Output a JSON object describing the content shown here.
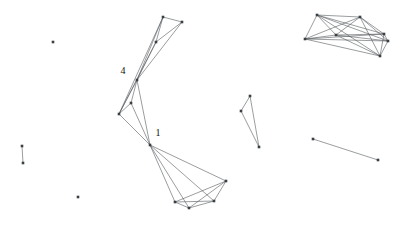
{
  "figure": {
    "title": "",
    "background_color": "#ffffff",
    "width": 413,
    "height": 235
  },
  "chart_data": {
    "type": "scatter",
    "title": "",
    "xlabel": "",
    "ylabel": "",
    "xlim": [
      0,
      413
    ],
    "ylim": [
      0,
      235
    ],
    "grid": false,
    "legend": null,
    "node_color": "#3a3f44",
    "edge_color": "#555a5e",
    "node_size": 2.6,
    "edge_width": 0.6,
    "nodes": [
      {
        "id": "n0",
        "x": 163,
        "y": 17,
        "label": ""
      },
      {
        "id": "n1",
        "x": 182,
        "y": 22,
        "label": ""
      },
      {
        "id": "n2",
        "x": 156,
        "y": 42,
        "label": ""
      },
      {
        "id": "n3",
        "x": 137,
        "y": 80,
        "label": "4"
      },
      {
        "id": "n4",
        "x": 131,
        "y": 103,
        "label": ""
      },
      {
        "id": "n5",
        "x": 119,
        "y": 114,
        "label": ""
      },
      {
        "id": "n6",
        "x": 150,
        "y": 145,
        "label": "1"
      },
      {
        "id": "n7",
        "x": 226,
        "y": 181,
        "label": ""
      },
      {
        "id": "n8",
        "x": 175,
        "y": 202,
        "label": ""
      },
      {
        "id": "n9",
        "x": 214,
        "y": 201,
        "label": ""
      },
      {
        "id": "n10",
        "x": 189,
        "y": 208,
        "label": ""
      },
      {
        "id": "n11",
        "x": 250,
        "y": 96,
        "label": ""
      },
      {
        "id": "n12",
        "x": 241,
        "y": 111,
        "label": ""
      },
      {
        "id": "n13",
        "x": 259,
        "y": 147,
        "label": ""
      },
      {
        "id": "n14",
        "x": 317,
        "y": 15,
        "label": ""
      },
      {
        "id": "n15",
        "x": 360,
        "y": 17,
        "label": ""
      },
      {
        "id": "n16",
        "x": 305,
        "y": 39,
        "label": ""
      },
      {
        "id": "n17",
        "x": 336,
        "y": 35,
        "label": ""
      },
      {
        "id": "n18",
        "x": 384,
        "y": 34,
        "label": ""
      },
      {
        "id": "n19",
        "x": 388,
        "y": 41,
        "label": ""
      },
      {
        "id": "n20",
        "x": 380,
        "y": 56,
        "label": ""
      },
      {
        "id": "n21",
        "x": 313,
        "y": 139,
        "label": ""
      },
      {
        "id": "n22",
        "x": 378,
        "y": 160,
        "label": ""
      },
      {
        "id": "n23",
        "x": 22,
        "y": 146,
        "label": ""
      },
      {
        "id": "n24",
        "x": 23,
        "y": 163,
        "label": ""
      },
      {
        "id": "n25",
        "x": 53,
        "y": 42,
        "label": ""
      },
      {
        "id": "n26",
        "x": 78,
        "y": 197,
        "label": ""
      }
    ],
    "edges": [
      [
        "n0",
        "n1"
      ],
      [
        "n0",
        "n2"
      ],
      [
        "n0",
        "n3"
      ],
      [
        "n1",
        "n2"
      ],
      [
        "n1",
        "n3"
      ],
      [
        "n2",
        "n3"
      ],
      [
        "n0",
        "n5"
      ],
      [
        "n2",
        "n5"
      ],
      [
        "n3",
        "n4"
      ],
      [
        "n3",
        "n5"
      ],
      [
        "n3",
        "n6"
      ],
      [
        "n4",
        "n5"
      ],
      [
        "n4",
        "n6"
      ],
      [
        "n5",
        "n6"
      ],
      [
        "n6",
        "n7"
      ],
      [
        "n6",
        "n8"
      ],
      [
        "n6",
        "n9"
      ],
      [
        "n6",
        "n10"
      ],
      [
        "n7",
        "n8"
      ],
      [
        "n7",
        "n9"
      ],
      [
        "n7",
        "n10"
      ],
      [
        "n8",
        "n9"
      ],
      [
        "n8",
        "n10"
      ],
      [
        "n9",
        "n10"
      ],
      [
        "n11",
        "n12"
      ],
      [
        "n11",
        "n13"
      ],
      [
        "n12",
        "n13"
      ],
      [
        "n14",
        "n15"
      ],
      [
        "n14",
        "n16"
      ],
      [
        "n14",
        "n17"
      ],
      [
        "n14",
        "n18"
      ],
      [
        "n14",
        "n19"
      ],
      [
        "n14",
        "n20"
      ],
      [
        "n15",
        "n16"
      ],
      [
        "n15",
        "n17"
      ],
      [
        "n15",
        "n18"
      ],
      [
        "n15",
        "n19"
      ],
      [
        "n15",
        "n20"
      ],
      [
        "n16",
        "n17"
      ],
      [
        "n16",
        "n18"
      ],
      [
        "n16",
        "n19"
      ],
      [
        "n16",
        "n20"
      ],
      [
        "n17",
        "n18"
      ],
      [
        "n17",
        "n19"
      ],
      [
        "n17",
        "n20"
      ],
      [
        "n18",
        "n19"
      ],
      [
        "n18",
        "n20"
      ],
      [
        "n19",
        "n20"
      ],
      [
        "n21",
        "n22"
      ],
      [
        "n23",
        "n24"
      ]
    ],
    "labels": [
      {
        "text": "4",
        "x": 123,
        "y": 72
      },
      {
        "text": "1",
        "x": 158,
        "y": 134
      }
    ]
  }
}
